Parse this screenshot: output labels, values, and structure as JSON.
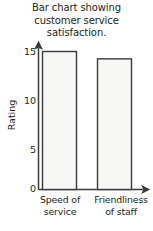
{
  "chart_data": {
    "type": "bar",
    "title": "Bar chart showing customer service satisfaction.",
    "title_lines": [
      "Bar chart showing",
      "customer service",
      "satisfaction."
    ],
    "categories": [
      "Speed of service",
      "Friendliness of staff"
    ],
    "category_lines": [
      [
        "Speed of",
        "service"
      ],
      [
        "Friendliness",
        "of staff"
      ]
    ],
    "values": [
      15,
      14.2
    ],
    "xlabel": "",
    "ylabel": "Rating",
    "ylim": [
      0,
      16
    ],
    "yticks": [
      0,
      5,
      10,
      15
    ],
    "ytick_labels": [
      "0",
      "5",
      "10",
      "15"
    ],
    "grid": false,
    "legend": false,
    "axis_style": {
      "x_axis_arrow": true,
      "y_axis_arrow": true,
      "axis_color": "#3a3a3a",
      "bar_fill": "#f7f7f5",
      "bar_border": "#3a3a3a",
      "background": "#ffffff"
    }
  }
}
